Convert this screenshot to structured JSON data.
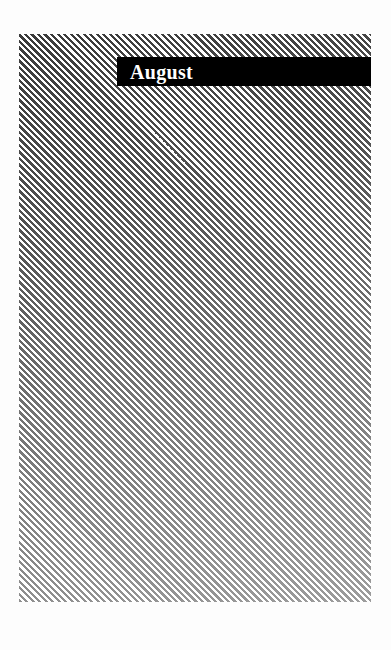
{
  "cover": {
    "title": "August",
    "colors": {
      "stripe_dark": "#3a3a3a",
      "stripe_light": "#ffffff",
      "title_bar": "#000000",
      "title_text": "#ffffff",
      "page_background": "#fdfdfd"
    },
    "pattern": "diagonal-stripes"
  }
}
